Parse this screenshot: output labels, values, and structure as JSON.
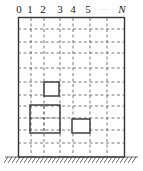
{
  "diagram": {
    "column_labels": [
      {
        "text": "0",
        "x": 19
      },
      {
        "text": "1",
        "x": 30
      },
      {
        "text": "2",
        "x": 43
      },
      {
        "text": "3",
        "x": 60
      },
      {
        "text": "4",
        "x": 73
      },
      {
        "text": "5",
        "x": 88
      },
      {
        "text": "···",
        "x": 104
      },
      {
        "text": "N",
        "x": 122
      }
    ],
    "building": {
      "x": 18,
      "y": 17,
      "width": 107,
      "height": 140
    },
    "vertical_grid_x": [
      31,
      44,
      60,
      73,
      90,
      107
    ],
    "horizontal_grid_y": [
      29,
      42,
      53,
      68,
      82,
      95,
      106,
      118,
      130,
      143
    ],
    "windows": [
      {
        "name": "upper-small-window",
        "x": 44,
        "y": 82,
        "width": 15,
        "height": 14
      },
      {
        "name": "large-window",
        "x": 30,
        "y": 105,
        "width": 30,
        "height": 28
      },
      {
        "name": "lower-small-window",
        "x": 72,
        "y": 119,
        "width": 18,
        "height": 14
      }
    ],
    "ground": {
      "x1": 5,
      "x2": 138,
      "y": 157
    },
    "colors": {
      "line": "#333333",
      "grid": "#555555"
    }
  }
}
